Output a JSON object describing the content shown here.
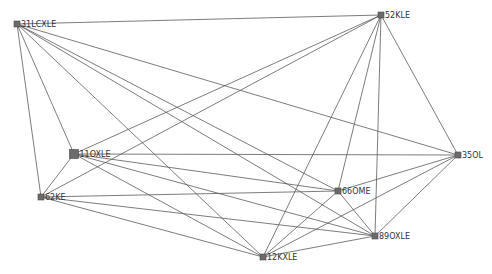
{
  "graph": {
    "nodes": [
      {
        "id": "31LCXLE",
        "label": "31LCXLE",
        "x": 17,
        "y": 24,
        "size": 6
      },
      {
        "id": "52KLE",
        "label": "52KLE",
        "x": 381,
        "y": 15,
        "size": 6
      },
      {
        "id": "11OXLE",
        "label": "11OXLE",
        "x": 74,
        "y": 154,
        "size": 9
      },
      {
        "id": "62KE",
        "label": "62KE",
        "x": 41,
        "y": 197,
        "size": 6
      },
      {
        "id": "66OME",
        "label": "66OME",
        "x": 338,
        "y": 191,
        "size": 6
      },
      {
        "id": "35OL",
        "label": "35OL",
        "x": 458,
        "y": 155,
        "size": 6
      },
      {
        "id": "89OXLE",
        "label": "89OXLE",
        "x": 375,
        "y": 236,
        "size": 6
      },
      {
        "id": "12KXLE",
        "label": "12KXLE",
        "x": 263,
        "y": 257,
        "size": 6
      }
    ],
    "edges": [
      [
        "31LCXLE",
        "52KLE"
      ],
      [
        "31LCXLE",
        "11OXLE"
      ],
      [
        "31LCXLE",
        "62KE"
      ],
      [
        "31LCXLE",
        "66OME"
      ],
      [
        "31LCXLE",
        "35OL"
      ],
      [
        "31LCXLE",
        "89OXLE"
      ],
      [
        "31LCXLE",
        "12KXLE"
      ],
      [
        "52KLE",
        "11OXLE"
      ],
      [
        "52KLE",
        "62KE"
      ],
      [
        "52KLE",
        "66OME"
      ],
      [
        "52KLE",
        "35OL"
      ],
      [
        "52KLE",
        "89OXLE"
      ],
      [
        "52KLE",
        "12KXLE"
      ],
      [
        "11OXLE",
        "62KE"
      ],
      [
        "11OXLE",
        "66OME"
      ],
      [
        "11OXLE",
        "35OL"
      ],
      [
        "11OXLE",
        "89OXLE"
      ],
      [
        "11OXLE",
        "12KXLE"
      ],
      [
        "62KE",
        "66OME"
      ],
      [
        "62KE",
        "89OXLE"
      ],
      [
        "62KE",
        "12KXLE"
      ],
      [
        "66OME",
        "35OL"
      ],
      [
        "66OME",
        "89OXLE"
      ],
      [
        "66OME",
        "12KXLE"
      ],
      [
        "35OL",
        "89OXLE"
      ],
      [
        "35OL",
        "12KXLE"
      ],
      [
        "89OXLE",
        "12KXLE"
      ]
    ]
  }
}
